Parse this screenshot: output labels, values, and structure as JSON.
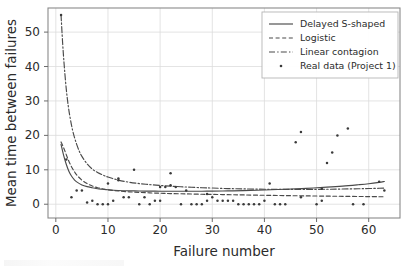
{
  "chart_data": {
    "type": "scatter",
    "title": "",
    "xlabel": "Failure number",
    "ylabel": "Mean time between failures",
    "xlim": [
      -1.5,
      66
    ],
    "ylim": [
      -4,
      57
    ],
    "xticks": [
      0,
      10,
      20,
      30,
      40,
      50,
      60
    ],
    "yticks": [
      0,
      10,
      20,
      30,
      40,
      50
    ],
    "grid": true,
    "legend_position": "upper right",
    "legend_entries": [
      {
        "label": "Delayed S-shaped",
        "style": "solid"
      },
      {
        "label": "Logistic",
        "style": "dashed"
      },
      {
        "label": "Linear contagion",
        "style": "dashdot"
      },
      {
        "label": "Real data (Project 1)",
        "style": "marker"
      }
    ],
    "series": [
      {
        "name": "Delayed S-shaped",
        "style": "solid",
        "x": [
          1,
          1.5,
          2,
          2.5,
          3,
          3.5,
          4,
          5,
          6,
          7,
          8,
          9,
          10,
          12,
          14,
          16,
          18,
          20,
          22,
          25,
          28,
          30,
          33,
          36,
          40,
          44,
          48,
          52,
          55,
          58,
          60,
          62,
          63
        ],
        "y": [
          17.4,
          14.2,
          11.6,
          9.6,
          8.2,
          7.2,
          6.5,
          5.6,
          5.1,
          4.8,
          4.5,
          4.35,
          4.2,
          4.0,
          3.9,
          3.85,
          3.8,
          3.78,
          3.76,
          3.76,
          3.78,
          3.8,
          3.86,
          3.95,
          4.12,
          4.35,
          4.62,
          4.95,
          5.25,
          5.65,
          5.95,
          6.35,
          6.6
        ]
      },
      {
        "name": "Logistic",
        "style": "dashed",
        "x": [
          1,
          1.5,
          2,
          2.5,
          3,
          3.5,
          4,
          5,
          6,
          7,
          8,
          9,
          10,
          12,
          14,
          16,
          18,
          20,
          22,
          25,
          28,
          30,
          33,
          36,
          40,
          44,
          48,
          52,
          55,
          58,
          60,
          62,
          63
        ],
        "y": [
          18.1,
          16.4,
          14.4,
          12.5,
          10.9,
          9.6,
          8.5,
          7.0,
          6.0,
          5.3,
          4.8,
          4.45,
          4.2,
          3.85,
          3.6,
          3.45,
          3.3,
          3.2,
          3.1,
          3.0,
          2.9,
          2.85,
          2.78,
          2.7,
          2.6,
          2.5,
          2.42,
          2.35,
          2.3,
          2.25,
          2.22,
          2.18,
          2.15
        ]
      },
      {
        "name": "Linear contagion",
        "style": "dashdot",
        "x": [
          1,
          1.3,
          1.6,
          2,
          2.4,
          2.8,
          3.2,
          3.6,
          4,
          4.5,
          5,
          6,
          7,
          8,
          9,
          10,
          12,
          14,
          16,
          18,
          20,
          22,
          25,
          28,
          30,
          33,
          36,
          40,
          44,
          48,
          52,
          55,
          58,
          60,
          62,
          63
        ],
        "y": [
          55.0,
          47.0,
          40.5,
          33.5,
          28.4,
          24.6,
          21.6,
          19.3,
          17.4,
          15.4,
          13.9,
          11.7,
          10.2,
          9.2,
          8.5,
          7.9,
          7.0,
          6.4,
          6.0,
          5.7,
          5.45,
          5.25,
          5.0,
          4.8,
          4.7,
          4.55,
          4.45,
          4.35,
          4.3,
          4.3,
          4.35,
          4.42,
          4.5,
          4.56,
          4.63,
          4.67
        ]
      }
    ],
    "scatter": {
      "name": "Real data (Project 1)",
      "points": [
        [
          1,
          55.0
        ],
        [
          2,
          13.0
        ],
        [
          3,
          2.0
        ],
        [
          4,
          4.0
        ],
        [
          5,
          4.0
        ],
        [
          6,
          0.5
        ],
        [
          7,
          1.0
        ],
        [
          8,
          0.0
        ],
        [
          9,
          0.0
        ],
        [
          10,
          0.0
        ],
        [
          10,
          6.0
        ],
        [
          11,
          1.0
        ],
        [
          12,
          7.0
        ],
        [
          12,
          7.5
        ],
        [
          13,
          2.0
        ],
        [
          14,
          2.0
        ],
        [
          15,
          10.0
        ],
        [
          16,
          0.0
        ],
        [
          17,
          2.0
        ],
        [
          18,
          0.0
        ],
        [
          19,
          1.0
        ],
        [
          20,
          1.0
        ],
        [
          20,
          5.0
        ],
        [
          21,
          5.0
        ],
        [
          22,
          9.0
        ],
        [
          22,
          5.5
        ],
        [
          23,
          5.0
        ],
        [
          24,
          0.0
        ],
        [
          25,
          4.0
        ],
        [
          26,
          0.0
        ],
        [
          27,
          0.0
        ],
        [
          28,
          0.0
        ],
        [
          29,
          3.0
        ],
        [
          29,
          1.0
        ],
        [
          30,
          2.0
        ],
        [
          31,
          1.0
        ],
        [
          32,
          1.0
        ],
        [
          33,
          1.0
        ],
        [
          34,
          1.0
        ],
        [
          35,
          0.0
        ],
        [
          36,
          0.0
        ],
        [
          37,
          0.0
        ],
        [
          38,
          0.0
        ],
        [
          39,
          0.0
        ],
        [
          40,
          1.0
        ],
        [
          41,
          6.0
        ],
        [
          42,
          0.0
        ],
        [
          43,
          0.0
        ],
        [
          44,
          0.0
        ],
        [
          46,
          18.0
        ],
        [
          47,
          21.0
        ],
        [
          47,
          2.0
        ],
        [
          50,
          0.0
        ],
        [
          51,
          1.0
        ],
        [
          51,
          4.5
        ],
        [
          52,
          12.0
        ],
        [
          53,
          15.0
        ],
        [
          54,
          20.0
        ],
        [
          56,
          22.0
        ],
        [
          57,
          0.0
        ],
        [
          59,
          0.0
        ],
        [
          62,
          6.5
        ],
        [
          63,
          4.0
        ]
      ]
    }
  },
  "colors": {
    "background": "#ffffff",
    "line": "#4a4a4a",
    "marker": "#3a3a3a",
    "grid": "#dcdcdc",
    "frame": "#8a8a8a",
    "text": "#2b2b2b"
  }
}
